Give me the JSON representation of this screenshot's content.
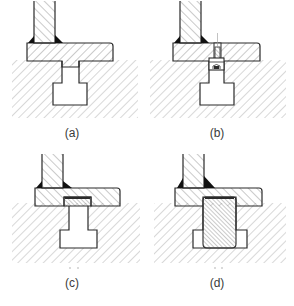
{
  "figure": {
    "type": "technical cross-section diagram",
    "panels": [
      {
        "id": "a",
        "label": "(a)",
        "description": "Welded post on base plate with tenon seated in T-slot"
      },
      {
        "id": "b",
        "label": "(b)",
        "description": "Base plate fastened with bolt into T-slot nut"
      },
      {
        "id": "c",
        "label": "(c)",
        "description": "Base plate with recessed thin insert over T-slot"
      },
      {
        "id": "d",
        "label": "(d)",
        "description": "Base plate with large cross-hatched block filling T-slot"
      }
    ]
  },
  "colors": {
    "line": "#2a2a2a",
    "hatch": "#9a9a9a",
    "weld": "#111111",
    "background": "#ffffff",
    "label": "#3a3a3a"
  }
}
